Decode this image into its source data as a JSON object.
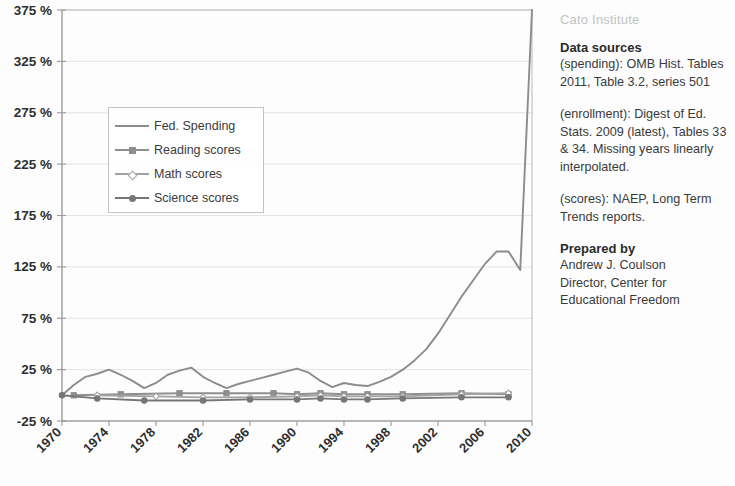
{
  "chart_data": {
    "type": "line",
    "title": "",
    "xlabel": "",
    "ylabel": "",
    "xlim": [
      1970,
      2010
    ],
    "ylim": [
      -25,
      375
    ],
    "grid": true,
    "legend_position": "upper-left",
    "y_ticks": [
      "-25 %",
      "25 %",
      "75 %",
      "125 %",
      "175 %",
      "225 %",
      "275 %",
      "325 %",
      "375 %"
    ],
    "y_tick_values": [
      -25,
      25,
      75,
      125,
      175,
      225,
      275,
      325,
      375
    ],
    "x_ticks": [
      "1970",
      "1974",
      "1978",
      "1982",
      "1986",
      "1990",
      "1994",
      "1998",
      "2002",
      "2006",
      "2010"
    ],
    "x_tick_values": [
      1970,
      1974,
      1978,
      1982,
      1986,
      1990,
      1994,
      1998,
      2002,
      2006,
      2010
    ],
    "series": [
      {
        "name": "Fed. Spending",
        "color": "#8c8c8c",
        "marker": "none",
        "x": [
          1970,
          1971,
          1972,
          1973,
          1974,
          1975,
          1976,
          1977,
          1978,
          1979,
          1980,
          1981,
          1982,
          1983,
          1984,
          1985,
          1986,
          1987,
          1988,
          1989,
          1990,
          1991,
          1992,
          1993,
          1994,
          1995,
          1996,
          1997,
          1998,
          1999,
          2000,
          2001,
          2002,
          2003,
          2004,
          2005,
          2006,
          2007,
          2008,
          2009,
          2010
        ],
        "values": [
          0,
          10,
          18,
          21,
          25,
          20,
          14,
          7,
          12,
          20,
          24,
          27,
          18,
          12,
          7,
          11,
          14,
          17,
          20,
          23,
          26,
          22,
          14,
          8,
          12,
          10,
          9,
          13,
          18,
          25,
          34,
          45,
          60,
          78,
          96,
          112,
          128,
          140,
          140,
          122,
          375
        ]
      },
      {
        "name": "Reading scores",
        "color": "#8f8f8f",
        "marker": "square",
        "x": [
          1971,
          1975,
          1980,
          1984,
          1988,
          1990,
          1992,
          1994,
          1996,
          1999,
          2004,
          2008
        ],
        "values": [
          0,
          1,
          2,
          2,
          2,
          1,
          2,
          1,
          1,
          1,
          2,
          1
        ]
      },
      {
        "name": "Math scores",
        "color": "#a2a2a2",
        "marker": "diamond",
        "x": [
          1973,
          1978,
          1982,
          1986,
          1990,
          1992,
          1994,
          1996,
          1999,
          2004,
          2008
        ],
        "values": [
          0,
          -1,
          -2,
          -2,
          -1,
          0,
          -1,
          -1,
          -1,
          1,
          2
        ]
      },
      {
        "name": "Science scores",
        "color": "#777777",
        "marker": "circle",
        "x": [
          1970,
          1973,
          1977,
          1982,
          1986,
          1990,
          1992,
          1994,
          1996,
          1999,
          2004,
          2008
        ],
        "values": [
          0,
          -3,
          -5,
          -5,
          -4,
          -4,
          -3,
          -4,
          -4,
          -3,
          -2,
          -2
        ]
      }
    ]
  },
  "legend": {
    "items": [
      {
        "label": "Fed. Spending"
      },
      {
        "label": "Reading scores"
      },
      {
        "label": "Math scores"
      },
      {
        "label": "Science scores"
      }
    ]
  },
  "sidebar": {
    "brand": "Cato Institute",
    "data_sources_heading": "Data sources",
    "source_spending": "(spending): OMB Hist. Tables 2011, Table 3.2, series 501",
    "source_enrollment": "(enrollment): Digest of Ed. Stats. 2009 (latest), Tables 33 & 34. Missing years linearly interpolated.",
    "source_scores": "(scores): NAEP, Long Term Trends reports.",
    "prepared_heading": "Prepared by",
    "prepared_name": "Andrew J. Coulson",
    "prepared_title": "Director, Center for Educational Freedom"
  }
}
